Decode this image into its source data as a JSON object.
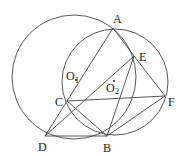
{
  "diagram": {
    "type": "geometry",
    "stroke_color": "#444444",
    "points": {
      "A": {
        "label": "A",
        "x": 113,
        "y": 28
      },
      "E": {
        "label": "E",
        "x": 134,
        "y": 56
      },
      "F": {
        "label": "F",
        "x": 165,
        "y": 96
      },
      "C": {
        "label": "C",
        "x": 67,
        "y": 101
      },
      "D": {
        "label": "D",
        "x": 45,
        "y": 136
      },
      "B": {
        "label": "B",
        "x": 107,
        "y": 136
      }
    },
    "centers": {
      "O1": {
        "label": "O",
        "sub": "1",
        "x": 74,
        "y": 77
      },
      "O2": {
        "label": "O",
        "sub": "2",
        "x": 113,
        "y": 82
      }
    },
    "circles": [
      {
        "name": "circle-O1",
        "cx": 74,
        "cy": 77,
        "r": 62
      },
      {
        "name": "circle-O2",
        "cx": 115,
        "cy": 82,
        "r": 53
      }
    ],
    "segments": [
      "AD",
      "AE",
      "EF",
      "DE",
      "EB",
      "CF",
      "CB",
      "DB",
      "BF"
    ]
  }
}
